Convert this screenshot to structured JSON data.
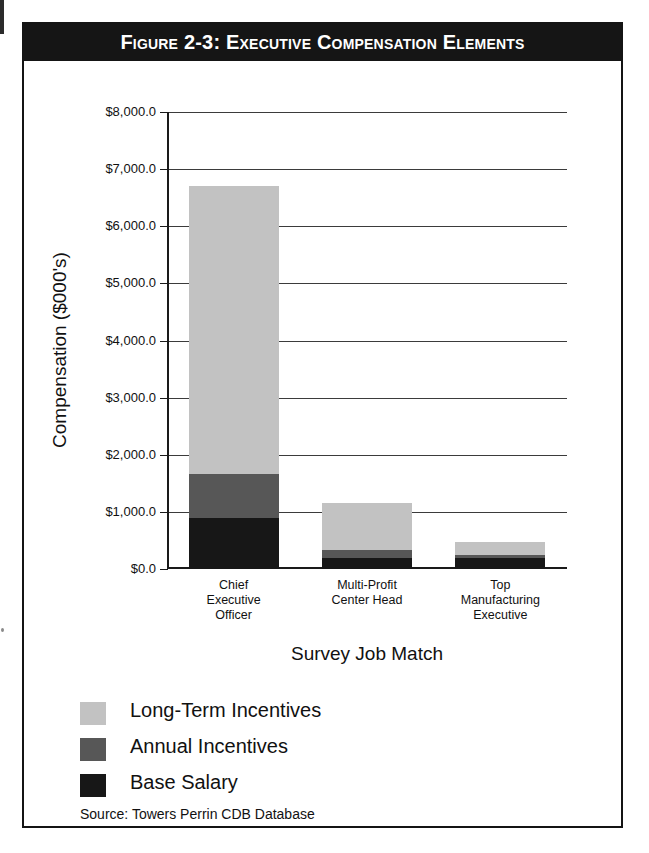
{
  "figure": {
    "title": "Figure 2-3: Executive Compensation Elements",
    "source_note": "Source: Towers Perrin CDB Database"
  },
  "chart_data": {
    "type": "bar",
    "stacked": true,
    "title": "Figure 2-3: Executive Compensation Elements",
    "xlabel": "Survey Job Match",
    "ylabel": "Compensation ($000's)",
    "ylim": [
      0,
      8000
    ],
    "ytick_labels": [
      "$8,000.0",
      "$7,000.0",
      "$6,000.0",
      "$5,000.0",
      "$4,000.0",
      "$3,000.0",
      "$2,000.0",
      "$1,000.0",
      "$0.0"
    ],
    "ytick_values": [
      8000,
      7000,
      6000,
      5000,
      4000,
      3000,
      2000,
      1000,
      0
    ],
    "grid": true,
    "legend_position": "below-plot-left",
    "categories": [
      "Chief Executive Officer",
      "Multi-Profit Center Head",
      "Top Manufacturing Executive"
    ],
    "category_lines": [
      [
        "Chief",
        "Executive",
        "Officer"
      ],
      [
        "Multi-Profit",
        "Center Head"
      ],
      [
        "Top",
        "Manufacturing",
        "Executive"
      ]
    ],
    "series": [
      {
        "name": "Base Salary",
        "color": "#171717",
        "values": [
          900,
          190,
          190
        ]
      },
      {
        "name": "Annual Incentives",
        "color": "#575757",
        "values": [
          770,
          145,
          55
        ]
      },
      {
        "name": "Long-Term Incentives",
        "color": "#c2c2c2",
        "values": [
          5030,
          825,
          230
        ]
      }
    ],
    "totals": [
      6700,
      1160,
      475
    ],
    "legend": [
      {
        "label": "Long-Term Incentives",
        "color": "#c2c2c2"
      },
      {
        "label": "Annual Incentives",
        "color": "#575757"
      },
      {
        "label": "Base Salary",
        "color": "#171717"
      }
    ]
  }
}
